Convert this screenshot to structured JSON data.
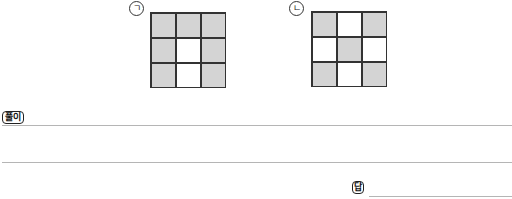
{
  "figures": [
    {
      "label": "ㄱ",
      "cells": [
        [
          "shaded",
          "shaded",
          "shaded"
        ],
        [
          "shaded",
          "blank",
          "shaded"
        ],
        [
          "shaded",
          "blank",
          "shaded"
        ]
      ]
    },
    {
      "label": "ㄴ",
      "cells": [
        [
          "shaded",
          "blank",
          "shaded"
        ],
        [
          "blank",
          "shaded",
          "blank"
        ],
        [
          "shaded",
          "blank",
          "shaded"
        ]
      ]
    }
  ],
  "solution": {
    "label": "풀이"
  },
  "answer": {
    "label": "답"
  },
  "colors": {
    "shaded": "#d4d4d4",
    "line": "#b5b5b5",
    "border": "#333333"
  }
}
